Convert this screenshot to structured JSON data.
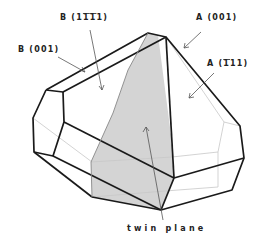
{
  "diagram": {
    "labels": {
      "b_1bar1bar1": {
        "prefix": "B (1",
        "bar1": "1",
        "bar2": "1",
        "suffix": "1)"
      },
      "b_001": "B (001)",
      "a_001": "A (001)",
      "a_bar111": {
        "prefix": "A (",
        "bar": "1",
        "suffix": "11)"
      },
      "twin_plane": "twin plane"
    },
    "colors": {
      "edge": "#1a1a1a",
      "hidden_edge": "#c8c8c8",
      "twin_plane_fill": "#d4d4d4",
      "pointer": "#555555"
    }
  }
}
